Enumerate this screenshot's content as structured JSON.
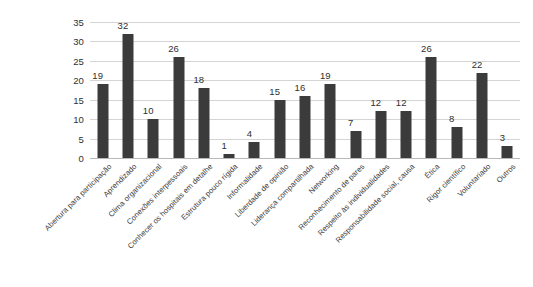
{
  "chart_data": {
    "type": "bar",
    "title": "",
    "subtitle": "",
    "xlabel": "",
    "ylabel": "",
    "ylim": [
      0,
      35
    ],
    "yticks": [
      0,
      5,
      10,
      15,
      20,
      25,
      30,
      35
    ],
    "grid": true,
    "legend": false,
    "legend_position": "none",
    "bar_color": "#3b3b3b",
    "gridline_color": "#d4d4d4",
    "background_color": "#ffffff",
    "text_color": "#2f2f2f",
    "categories": [
      "Abertura para participação",
      "Aprendizado",
      "Clima organizacional",
      "Conexões interpessoais",
      "Conhecer os hospitais em detalhe",
      "Estrutura pouco rígida",
      "Informalidade",
      "Liberdade de opinião",
      "Liderança compartilhada",
      "Networking",
      "Reconhecimento de pares",
      "Respeito às individualidades",
      "Responsabilidade social, causa",
      "Ética",
      "Rigor científico",
      "Voluntariado",
      "Outros"
    ],
    "values": [
      19,
      32,
      10,
      26,
      18,
      1,
      4,
      15,
      16,
      19,
      7,
      12,
      12,
      26,
      8,
      22,
      3
    ],
    "data_labels": [
      "19",
      "32",
      "10",
      "26",
      "18",
      "1",
      "4",
      "15",
      "16",
      "19",
      "7",
      "12",
      "12",
      "26",
      "8",
      "22",
      "3"
    ],
    "ytick_labels": [
      "0",
      "5",
      "10",
      "15",
      "20",
      "25",
      "30",
      "35"
    ]
  }
}
